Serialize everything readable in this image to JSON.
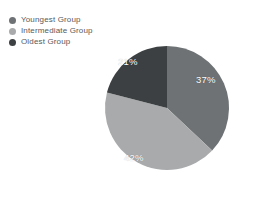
{
  "chart_data": {
    "type": "pie",
    "title": "",
    "subtitle": "",
    "xlabel": "",
    "ylabel": "",
    "grid": false,
    "legend_position": "top-left",
    "units": "percent",
    "total": 100,
    "start_angle_deg": 0,
    "direction": "clockwise",
    "categories": [
      "Youngest Group",
      "Intermediate Group",
      "Oldest Group"
    ],
    "values": [
      37,
      42,
      21
    ],
    "data_labels": [
      "37%",
      "42%",
      "21%"
    ],
    "colors": [
      "#6e7274",
      "#a8aaab",
      "#3c4042"
    ],
    "slices": [
      {
        "label": "Youngest Group",
        "value": 37,
        "data_label": "37%",
        "color": "#6e7274",
        "start_angle_deg": 0,
        "end_angle_deg": 133.2
      },
      {
        "label": "Intermediate Group",
        "value": 42,
        "data_label": "42%",
        "color": "#a8aaab",
        "start_angle_deg": 133.2,
        "end_angle_deg": 284.4
      },
      {
        "label": "Oldest Group",
        "value": 21,
        "data_label": "21%",
        "color": "#3c4042",
        "start_angle_deg": 284.4,
        "end_angle_deg": 360
      }
    ]
  },
  "legend": {
    "items": [
      {
        "label": "Youngest Group",
        "color": "#6e7274"
      },
      {
        "label": "Intermediate Group",
        "color": "#a8aaab"
      },
      {
        "label": "Oldest Group",
        "color": "#3c4042"
      }
    ]
  },
  "canvas": {
    "background": "#ffffff",
    "label_text_color": "#ffffff",
    "legend_text_color": "#58595b"
  }
}
